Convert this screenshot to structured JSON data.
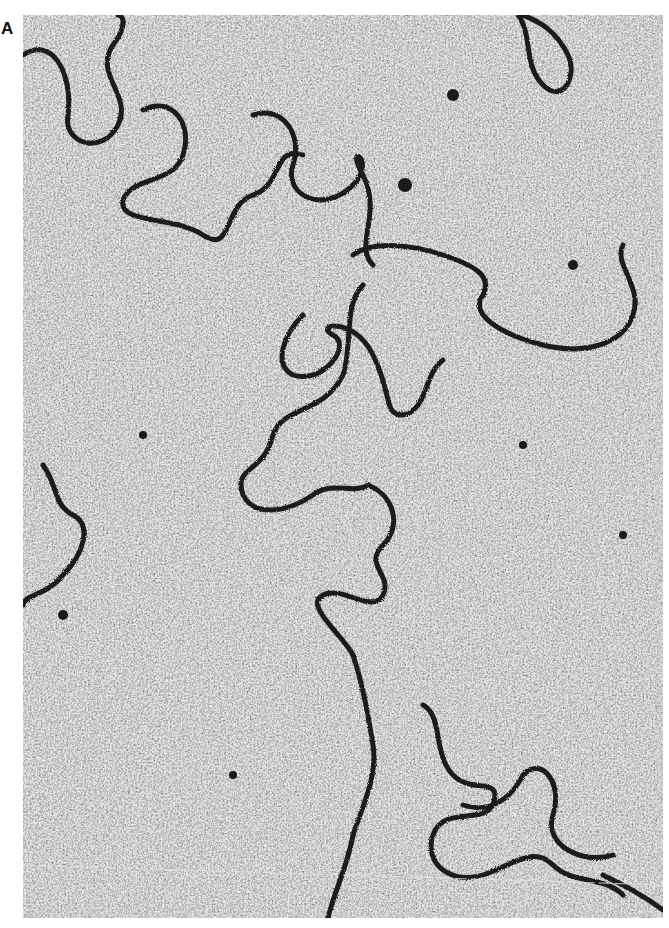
{
  "figure": {
    "panel_label": "A",
    "image": {
      "kind": "electron-micrograph",
      "subject": "DNA-strands",
      "tone": "grayscale",
      "colors": {
        "background_mid": "#8a8a8a",
        "grain_dark": "#2a2a2a",
        "grain_light": "#d8d8d8",
        "strand": "#1c1c1c"
      }
    }
  }
}
